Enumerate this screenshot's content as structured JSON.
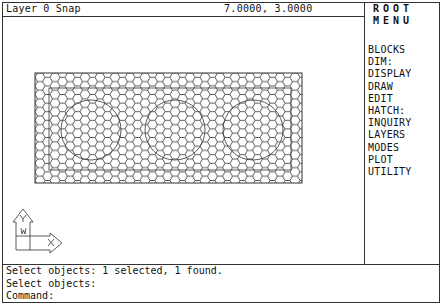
{
  "status_bar": {
    "layer_text": "Layer 0 Snap",
    "coordinates": "7.0000, 3.0000"
  },
  "screen_menu": {
    "title_line1": "ROOT",
    "title_line2": "MENU",
    "items": [
      {
        "label": "BLOCKS"
      },
      {
        "label": "DIM:"
      },
      {
        "label": "DISPLAY"
      },
      {
        "label": "DRAW"
      },
      {
        "label": "EDIT"
      },
      {
        "label": "HATCH:"
      },
      {
        "label": "INQUIRY"
      },
      {
        "label": "LAYERS"
      },
      {
        "label": "MODES"
      },
      {
        "label": "PLOT"
      },
      {
        "label": "UTILITY"
      }
    ]
  },
  "drawing": {
    "hatch_pattern": "honeycomb",
    "objects": [
      "outer-rectangle",
      "inner-rectangle",
      "circle",
      "circle",
      "circle"
    ],
    "ucs_icon": {
      "y_label": "Y",
      "x_label": "X",
      "w_label": "W"
    }
  },
  "command_history": {
    "lines": [
      "Select objects: 1 selected, 1 found.",
      "Select objects:",
      "Command:"
    ]
  },
  "colors": {
    "background": "#ffffff",
    "lines": "#333333"
  }
}
